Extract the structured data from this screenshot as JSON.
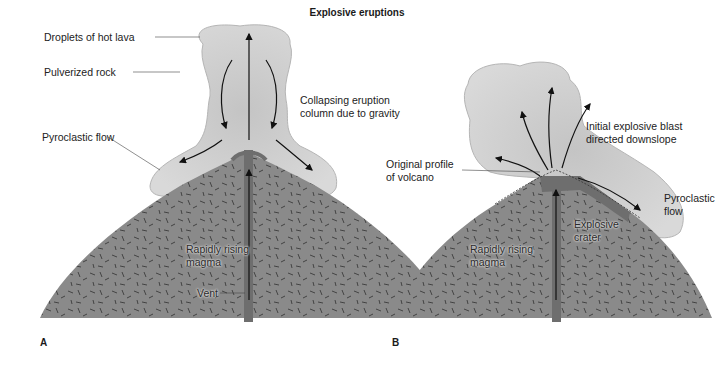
{
  "title": "Explosive eruptions",
  "colors": {
    "volcano_fill": "#8a8a8a",
    "volcano_dash": "#333333",
    "ash_cloud": "#cfcfcf",
    "ash_cloud_edge": "#b8b8b8",
    "conduit": "#6e6e6e",
    "arrow": "#111111",
    "label_text": "#222222"
  },
  "panels": [
    {
      "letter": "A",
      "labels": {
        "droplets": "Droplets of hot lava",
        "pulverized": "Pulverized rock",
        "pyroclastic": "Pyroclastic flow",
        "collapsing_1": "Collapsing eruption",
        "collapsing_2": "column due to gravity",
        "rising_1": "Rapidly rising",
        "rising_2": "magma",
        "vent": "Vent"
      }
    },
    {
      "letter": "B",
      "labels": {
        "original_1": "Original profile",
        "original_2": "of volcano",
        "blast_1": "Initial explosive blast",
        "blast_2": "directed downslope",
        "pyroclastic_1": "Pyroclastic",
        "pyroclastic_2": "flow",
        "crater_1": "Explosive",
        "crater_2": "crater",
        "rising_1": "Rapidly rising",
        "rising_2": "magma"
      }
    }
  ]
}
